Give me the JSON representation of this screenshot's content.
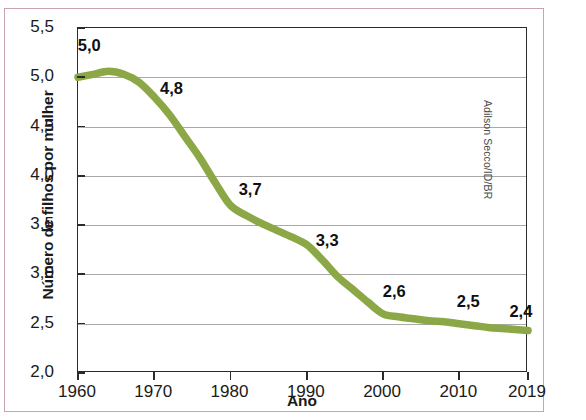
{
  "figure": {
    "credit": "Adilson Secco/ID/BR",
    "top_crop_text": "",
    "line_color": "#8CA846",
    "frame_color": "#2b2b2b",
    "outer_border_color": "#c9a3ae",
    "grid_color": "#9a9a9a"
  },
  "chart_data": {
    "type": "line",
    "title": "",
    "xlabel": "Ano",
    "ylabel": "Número de filhos por mulher",
    "xlim": [
      1960,
      2019
    ],
    "ylim": [
      2.0,
      5.5
    ],
    "grid": true,
    "legend": "none",
    "ytick_labels": [
      "5,5",
      "5,0",
      "4,5",
      "4,0",
      "3,5",
      "3,0",
      "2,5",
      "2,0"
    ],
    "ytick_values": [
      5.5,
      5.0,
      4.5,
      4.0,
      3.5,
      3.0,
      2.5,
      2.0
    ],
    "xtick_labels": [
      "1960",
      "1970",
      "1980",
      "1990",
      "2000",
      "2010",
      "2019"
    ],
    "xtick_values": [
      1960,
      1970,
      1980,
      1990,
      2000,
      2010,
      2019
    ],
    "labeled_points": [
      {
        "x": 1960,
        "y": 5.0,
        "label": "5,0",
        "lx": 1961.6,
        "ly": 5.32
      },
      {
        "x": 1970,
        "y": 4.8,
        "label": "4,8",
        "lx": 1972.4,
        "ly": 4.88
      },
      {
        "x": 1980,
        "y": 3.7,
        "label": "3,7",
        "lx": 1982.7,
        "ly": 3.86
      },
      {
        "x": 1990,
        "y": 3.3,
        "label": "3,3",
        "lx": 1992.8,
        "ly": 3.34
      },
      {
        "x": 2000,
        "y": 2.6,
        "label": "2,6",
        "lx": 2001.6,
        "ly": 2.82
      },
      {
        "x": 2010,
        "y": 2.5,
        "label": "2,5",
        "lx": 2011.3,
        "ly": 2.72
      },
      {
        "x": 2019,
        "y": 2.4,
        "label": "2,4",
        "lx": 2018.2,
        "ly": 2.62
      }
    ],
    "x": [
      1960,
      1962,
      1964,
      1966,
      1968,
      1970,
      1972,
      1974,
      1976,
      1978,
      1980,
      1982,
      1984,
      1986,
      1988,
      1990,
      1992,
      1994,
      1996,
      1998,
      2000,
      2002,
      2004,
      2006,
      2008,
      2010,
      2012,
      2014,
      2016,
      2019
    ],
    "values": [
      5.0,
      5.03,
      5.06,
      5.03,
      4.95,
      4.8,
      4.62,
      4.4,
      4.18,
      3.93,
      3.7,
      3.6,
      3.52,
      3.45,
      3.38,
      3.3,
      3.15,
      2.98,
      2.85,
      2.72,
      2.6,
      2.57,
      2.55,
      2.53,
      2.52,
      2.5,
      2.48,
      2.46,
      2.45,
      2.43
    ]
  }
}
